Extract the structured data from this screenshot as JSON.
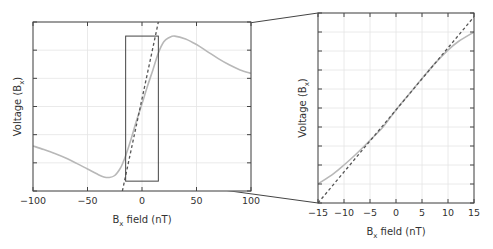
{
  "chart_data": [
    {
      "id": "overview",
      "type": "line",
      "title": "",
      "xlabel": "B",
      "xlabel_sub": "x",
      "xlabel_suffix": " field (nT)",
      "ylabel": "Voltage (B",
      "ylabel_sub": "x",
      "ylabel_suffix": ")",
      "xlim": [
        -100,
        100
      ],
      "ylim": [
        0,
        6
      ],
      "xticks": [
        -100,
        -50,
        0,
        50,
        100
      ],
      "xtick_labels": [
        "−100",
        "−50",
        "0",
        "50",
        "100"
      ],
      "yticks": [
        0,
        1,
        2,
        3,
        4,
        5,
        6
      ],
      "ytick_labels": [],
      "grid": true,
      "series": [
        {
          "name": "response",
          "style": "solid",
          "color": "#b8b8b8",
          "x": [
            -100,
            -90,
            -80,
            -70,
            -60,
            -50,
            -40,
            -35,
            -30,
            -25,
            -20,
            -17,
            -15,
            -10,
            -5,
            0,
            5,
            10,
            15,
            20,
            25,
            30,
            40,
            50,
            60,
            70,
            80,
            90,
            100
          ],
          "y": [
            1.6,
            1.47,
            1.33,
            1.17,
            0.98,
            0.78,
            0.58,
            0.5,
            0.48,
            0.55,
            0.8,
            1.05,
            1.25,
            1.85,
            2.5,
            3.1,
            3.72,
            4.3,
            4.9,
            5.3,
            5.45,
            5.5,
            5.4,
            5.2,
            4.95,
            4.7,
            4.48,
            4.3,
            4.18
          ]
        },
        {
          "name": "linear fit",
          "style": "dashed",
          "color": "#555555",
          "x": [
            -18,
            15
          ],
          "y": [
            0,
            6
          ]
        }
      ],
      "zoom_box": {
        "x": [
          -15,
          15
        ],
        "y": [
          0.35,
          5.5
        ]
      }
    },
    {
      "id": "zoomed",
      "type": "line",
      "title": "",
      "xlabel": "B",
      "xlabel_sub": "x",
      "xlabel_suffix": " field (nT)",
      "ylabel": "Voltage (B",
      "ylabel_sub": "x",
      "ylabel_suffix": ")",
      "xlim": [
        -15,
        15
      ],
      "ylim": [
        0,
        10
      ],
      "xticks": [
        -15,
        -10,
        -5,
        0,
        5,
        10,
        15
      ],
      "xtick_labels": [
        "−15",
        "−10",
        "−5",
        "0",
        "5",
        "10",
        "15"
      ],
      "yticks": [
        0,
        1,
        2,
        3,
        4,
        5,
        6,
        7,
        8,
        9,
        10
      ],
      "ytick_labels": [],
      "grid": true,
      "series": [
        {
          "name": "response",
          "style": "solid",
          "color": "#b8b8b8",
          "x": [
            -15,
            -12,
            -10,
            -7.5,
            -5,
            -2.5,
            0,
            2.5,
            5,
            7.5,
            10,
            12,
            15
          ],
          "y": [
            1.0,
            1.55,
            2.0,
            2.62,
            3.3,
            4.0,
            4.9,
            5.72,
            6.55,
            7.35,
            8.05,
            8.5,
            9.0
          ]
        },
        {
          "name": "linear fit",
          "style": "dashed",
          "color": "#555555",
          "x": [
            -15,
            15
          ],
          "y": [
            0,
            9.8
          ]
        }
      ]
    }
  ]
}
